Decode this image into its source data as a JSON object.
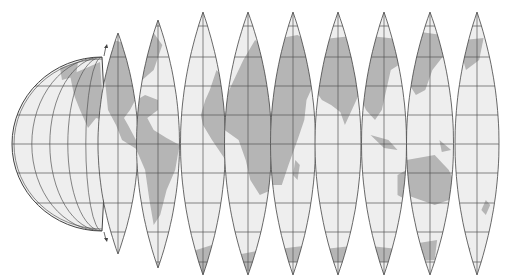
{
  "figure": {
    "description": "Globe gores: a hemisphere peeling into nine lens-shaped map segments of the world",
    "background": "#ffffff",
    "colors": {
      "ocean": "#eeeeee",
      "land": "#b5b5b5",
      "grid": "#555555",
      "outline": "#444444"
    },
    "equator_y": 144,
    "graticule_lat_y": [
      26,
      57,
      86,
      115,
      144,
      173,
      203,
      232,
      262
    ]
  },
  "hemisphere": {
    "label": "Western hemisphere globe (partially unpeeled)",
    "cx": 102,
    "cy": 144,
    "rx": 90,
    "ry": 87
  },
  "gores": [
    {
      "index": 1,
      "label": "Gore 1 – North America",
      "cx": 118,
      "left": 97,
      "right": 137,
      "top": 33,
      "bottom": 254
    },
    {
      "index": 2,
      "label": "Gore 2 – South America",
      "cx": 158,
      "left": 137,
      "right": 180,
      "top": 20,
      "bottom": 268
    },
    {
      "index": 3,
      "label": "Gore 3 – Atlantic / West Africa",
      "cx": 203,
      "left": 180,
      "right": 225,
      "top": 12,
      "bottom": 275
    },
    {
      "index": 4,
      "label": "Gore 4 – Europe / Africa",
      "cx": 248,
      "left": 225,
      "right": 272,
      "top": 12,
      "bottom": 275
    },
    {
      "index": 5,
      "label": "Gore 5 – Middle East / East Africa",
      "cx": 293,
      "left": 272,
      "right": 317,
      "top": 12,
      "bottom": 275
    },
    {
      "index": 6,
      "label": "Gore 6 – Central Asia / India",
      "cx": 338,
      "left": 317,
      "right": 363,
      "top": 12,
      "bottom": 275
    },
    {
      "index": 7,
      "label": "Gore 7 – East Asia / Indonesia",
      "cx": 384,
      "left": 363,
      "right": 408,
      "top": 12,
      "bottom": 275
    },
    {
      "index": 8,
      "label": "Gore 8 – Japan / Australia",
      "cx": 430,
      "left": 408,
      "right": 455,
      "top": 12,
      "bottom": 275
    },
    {
      "index": 9,
      "label": "Gore 9 – Pacific / New Zealand",
      "cx": 477,
      "left": 455,
      "right": 499,
      "top": 12,
      "bottom": 275
    }
  ]
}
